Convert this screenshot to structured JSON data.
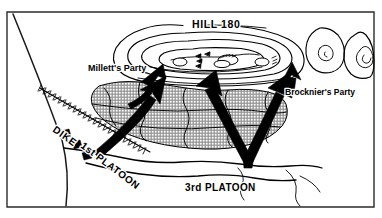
{
  "figure": {
    "kind": "hand-drawn military situation map",
    "width": 382,
    "height": 218,
    "background_color": "#ffffff",
    "ink_color": "#000000",
    "hatch_fill_color": "#9a9a9a"
  },
  "labels": {
    "hill": "HILL 180",
    "millett": "Millett's Party",
    "brocknier": "Brocknier's Party",
    "dike": "DIKE",
    "first_platoon": "1st PLATOON",
    "third_platoon": "3rd PLATOON"
  },
  "map_features": [
    {
      "name": "hill-180-contours",
      "type": "contour-set",
      "label": "HILL 180",
      "rings": 4
    },
    {
      "name": "east-knoll-north",
      "type": "contour-set",
      "rings": 2
    },
    {
      "name": "east-knoll-south",
      "type": "contour-set",
      "rings": 3
    },
    {
      "name": "hatched-field",
      "type": "crosshatched-terrain",
      "cells": 11
    },
    {
      "name": "dike",
      "type": "hatched-linear-embankment",
      "label": "DIKE"
    },
    {
      "name": "road",
      "type": "line",
      "orientation": "northwest-diagonal"
    },
    {
      "name": "stream-banks",
      "type": "line-pair",
      "orientation": "east-west"
    }
  ],
  "movement_arrows": [
    {
      "name": "millett-arrow",
      "label": "Millett's Party",
      "direction": "northeast",
      "target": "hill-west-end"
    },
    {
      "name": "first-platoon-arrow",
      "label": "1st PLATOON",
      "direction": "northeast",
      "target": "hatched-field-west"
    },
    {
      "name": "third-platoon-arrow-left",
      "label": "3rd PLATOON",
      "direction": "north",
      "target": "hatched-field-center"
    },
    {
      "name": "third-platoon-arrow-right",
      "label": "3rd PLATOON",
      "direction": "north-northeast",
      "target": "hatched-field-east"
    },
    {
      "name": "brocknier-arrow",
      "label": "Brocknier's Party",
      "direction": "north",
      "target": "hill-east-end"
    }
  ],
  "unit_marks": {
    "name": "platoon-position-marks",
    "count": 3,
    "shape": "filled-parallelogram"
  },
  "hilltop_positions": {
    "name": "enemy-emplacements",
    "count": 4,
    "shape": "small-oval-with-chevrons"
  }
}
